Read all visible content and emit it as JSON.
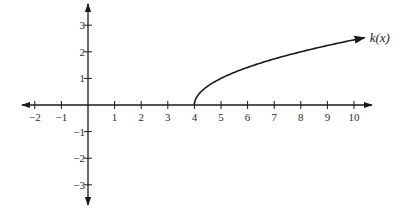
{
  "chart_data": {
    "type": "line",
    "title": "",
    "xlabel": "",
    "ylabel": "",
    "xlim": [
      -2.5,
      10.6
    ],
    "ylim": [
      -3.8,
      3.8
    ],
    "grid": false,
    "x_ticks": [
      -2,
      -1,
      1,
      2,
      3,
      4,
      5,
      6,
      7,
      8,
      9,
      10
    ],
    "x_tick_labels": [
      "−2",
      "−1",
      "1",
      "2",
      "3",
      "4",
      "5",
      "6",
      "7",
      "8",
      "9",
      "10"
    ],
    "y_ticks": [
      3,
      2,
      1,
      -1,
      -2,
      -3
    ],
    "y_tick_labels": [
      "3",
      "2",
      "1",
      "−1",
      "−2",
      "−3"
    ],
    "series": [
      {
        "name": "k(x)",
        "formula": "sqrt(x - 4)",
        "domain": [
          4,
          10.4
        ],
        "x": [
          4,
          4.25,
          5,
          6,
          7,
          8,
          9,
          10,
          10.4
        ],
        "y": [
          0,
          0.5,
          1,
          1.41,
          1.73,
          2,
          2.24,
          2.45,
          2.53
        ],
        "end_arrow": true,
        "label": "k(x)"
      }
    ],
    "axes": {
      "x_arrows": "both",
      "y_arrows": "both"
    }
  },
  "layout": {
    "origin_px": [
      88,
      105
    ],
    "unit_px": 26.6,
    "colors": {
      "axis": "#1a1a1a",
      "curve": "#1a1a1a",
      "text": "#2a2a2a",
      "background": "#ffffff"
    }
  }
}
